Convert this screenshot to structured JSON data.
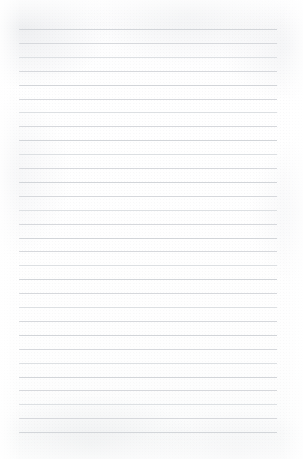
{
  "document": {
    "kind": "scanned-ruled-paper",
    "description": "Blank sheet of lined notebook paper, scanned",
    "content_text": "",
    "has_handwriting": false,
    "has_printed_text": false
  },
  "page": {
    "width_px": 303,
    "height_px": 459,
    "paper_color": "#fdfdfd",
    "background_tint": "#fafbfb"
  },
  "ruling": {
    "line_color": "#d9dbde",
    "line_thickness_px": 1,
    "line_count": 30,
    "line_left_px": 19,
    "line_right_px": 277,
    "line_width_px": 258,
    "first_line_y_px": 29,
    "last_line_y_px": 432,
    "line_spacing_px": 13.9,
    "margin_left_px": 19,
    "margin_right_px": 26,
    "margin_top_px": 29,
    "margin_bottom_px": 27,
    "has_vertical_margin_rule": false,
    "lines": [
      {
        "index": 1,
        "y": 29.0,
        "tone": "tone-c"
      },
      {
        "index": 2,
        "y": 42.9,
        "tone": "tone-a"
      },
      {
        "index": 3,
        "y": 56.8,
        "tone": "tone-b"
      },
      {
        "index": 4,
        "y": 70.7,
        "tone": "tone-a"
      },
      {
        "index": 5,
        "y": 84.6,
        "tone": "tone-c"
      },
      {
        "index": 6,
        "y": 98.5,
        "tone": "tone-a"
      },
      {
        "index": 7,
        "y": 112.4,
        "tone": "tone-b"
      },
      {
        "index": 8,
        "y": 126.3,
        "tone": "tone-a"
      },
      {
        "index": 9,
        "y": 140.2,
        "tone": "tone-c"
      },
      {
        "index": 10,
        "y": 154.1,
        "tone": "tone-b"
      },
      {
        "index": 11,
        "y": 168.0,
        "tone": "tone-a"
      },
      {
        "index": 12,
        "y": 181.9,
        "tone": "tone-c"
      },
      {
        "index": 13,
        "y": 195.8,
        "tone": "tone-a"
      },
      {
        "index": 14,
        "y": 209.7,
        "tone": "tone-b"
      },
      {
        "index": 15,
        "y": 223.6,
        "tone": "tone-a"
      },
      {
        "index": 16,
        "y": 237.5,
        "tone": "tone-c"
      },
      {
        "index": 17,
        "y": 251.4,
        "tone": "tone-a"
      },
      {
        "index": 18,
        "y": 265.3,
        "tone": "tone-b"
      },
      {
        "index": 19,
        "y": 279.2,
        "tone": "tone-c"
      },
      {
        "index": 20,
        "y": 293.1,
        "tone": "tone-a"
      },
      {
        "index": 21,
        "y": 307.0,
        "tone": "tone-b"
      },
      {
        "index": 22,
        "y": 320.9,
        "tone": "tone-a"
      },
      {
        "index": 23,
        "y": 334.8,
        "tone": "tone-c"
      },
      {
        "index": 24,
        "y": 348.7,
        "tone": "tone-a"
      },
      {
        "index": 25,
        "y": 362.6,
        "tone": "tone-b"
      },
      {
        "index": 26,
        "y": 376.5,
        "tone": "tone-c"
      },
      {
        "index": 27,
        "y": 390.4,
        "tone": "tone-a"
      },
      {
        "index": 28,
        "y": 404.3,
        "tone": "tone-b"
      },
      {
        "index": 29,
        "y": 418.2,
        "tone": "tone-a"
      },
      {
        "index": 30,
        "y": 432.1,
        "tone": "tone-c"
      }
    ]
  }
}
